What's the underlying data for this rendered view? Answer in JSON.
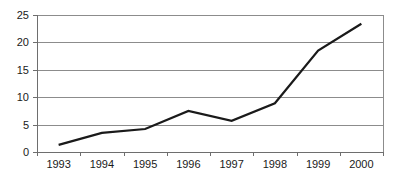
{
  "chart_data": {
    "type": "line",
    "title": "",
    "xlabel": "",
    "ylabel": "",
    "categories": [
      "1993",
      "1994",
      "1995",
      "1996",
      "1997",
      "1998",
      "1999",
      "2000"
    ],
    "values": [
      1.3,
      3.5,
      4.2,
      7.5,
      5.7,
      8.9,
      18.5,
      23.4
    ],
    "series": [
      {
        "name": "",
        "values": [
          1.3,
          3.5,
          4.2,
          7.5,
          5.7,
          8.9,
          18.5,
          23.4
        ]
      }
    ],
    "ylim": [
      0,
      25
    ],
    "yticks": [
      0,
      5,
      10,
      15,
      20,
      25
    ],
    "ytick_labels": [
      "0",
      "5",
      "10",
      "15",
      "20",
      "25"
    ],
    "xtick_labels": [
      "1993",
      "1994",
      "1995",
      "1996",
      "1997",
      "1998",
      "1999",
      "2000"
    ],
    "grid": true,
    "grid_axis": "y",
    "legend": false,
    "legend_position": "none",
    "line_color": "#1a1a1a",
    "grid_color": "#8c8c8c",
    "axis_color": "#6e6e6e",
    "background_color": "#ffffff"
  },
  "layout": {
    "plot_left": 37,
    "plot_right": 383,
    "plot_top": 15,
    "plot_bottom": 152
  }
}
